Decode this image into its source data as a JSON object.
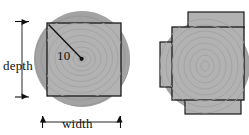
{
  "figure": {
    "colors": {
      "log_fill": "#a3a3a3",
      "board_fill": "#b0b0b0",
      "outline": "#1a1a1a",
      "ring": "#999999",
      "background": "#ffffff"
    },
    "labels": {
      "depth": "depth",
      "width": "width",
      "radius": "10"
    },
    "left_diagram": {
      "name": "single-board-cross-section",
      "log": {
        "cx": 82,
        "cy": 59,
        "r": 48
      },
      "board": {
        "x": 47,
        "y": 23,
        "width": 74,
        "height": 73
      },
      "radius_line": {
        "x1": 48,
        "y1": 24,
        "x2": 82,
        "y2": 59
      },
      "center_dot": {
        "cx": 82,
        "cy": 59,
        "r": 2
      },
      "depth_dimension": {
        "x": 22,
        "y1": 22,
        "y2": 98
      },
      "width_dimension": {
        "y": 122,
        "x1": 42,
        "x2": 121
      },
      "ring_count": 9
    },
    "right_diagram": {
      "name": "multi-board-cross-section",
      "log": {
        "cx": 205,
        "cy": 66,
        "r": 45
      },
      "center_board": {
        "x": 172,
        "y": 27,
        "width": 72,
        "height": 73
      },
      "flanges": [
        {
          "name": "top-flange",
          "x": 188,
          "y": 12,
          "width": 56,
          "height": 15
        },
        {
          "name": "left-flange",
          "x": 160,
          "y": 42,
          "width": 12,
          "height": 45
        },
        {
          "name": "bottom-flange",
          "x": 185,
          "y": 100,
          "width": 56,
          "height": 14
        }
      ],
      "ring_count": 9
    }
  }
}
